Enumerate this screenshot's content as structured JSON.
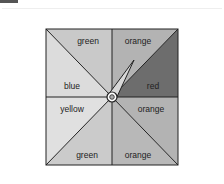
{
  "spinner": {
    "title": "",
    "sectors": [
      {
        "label": "green",
        "color": "#c9c9c9"
      },
      {
        "label": "orange",
        "color": "#b4b4b4"
      },
      {
        "label": "red",
        "color": "#6e6e6e"
      },
      {
        "label": "orange",
        "color": "#b4b4b4"
      },
      {
        "label": "orange",
        "color": "#b4b4b4"
      },
      {
        "label": "green",
        "color": "#c9c9c9"
      },
      {
        "label": "yellow",
        "color": "#e0e0e0"
      },
      {
        "label": "blue",
        "color": "#dadada"
      }
    ]
  }
}
